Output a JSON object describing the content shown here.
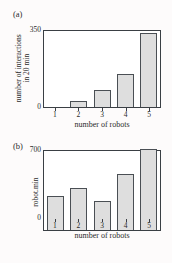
{
  "figure": {
    "background_color": "#fdfbfb",
    "bar_fill_color": "#dedede",
    "bar_edge_color": "#4a4f54",
    "axis_color": "#3a3f44"
  },
  "panels": [
    {
      "tag": "(a)",
      "chart_data": {
        "type": "bar",
        "title": "",
        "categories": [
          "1",
          "2",
          "3",
          "4",
          "5"
        ],
        "values": [
          0,
          25,
          75,
          150,
          330
        ],
        "xlabel": "number of robots",
        "ylabel_line1": "number of interactions",
        "ylabel_line2": "in 20 min",
        "ytick_labels": [
          "0",
          "350"
        ],
        "ylim": [
          0,
          350
        ],
        "grid": false,
        "legend": "none"
      }
    },
    {
      "tag": "(b)",
      "chart_data": {
        "type": "bar",
        "title": "",
        "categories": [
          "1",
          "2",
          "3",
          "4",
          "5"
        ],
        "values": [
          290,
          360,
          255,
          480,
          700
        ],
        "xlabel": "number of robots",
        "ylabel_line1": "robot.min",
        "ylabel_line2": "",
        "ytick_labels": [
          "0",
          "700"
        ],
        "ylim": [
          0,
          700
        ],
        "grid": false,
        "legend": "none"
      }
    }
  ]
}
